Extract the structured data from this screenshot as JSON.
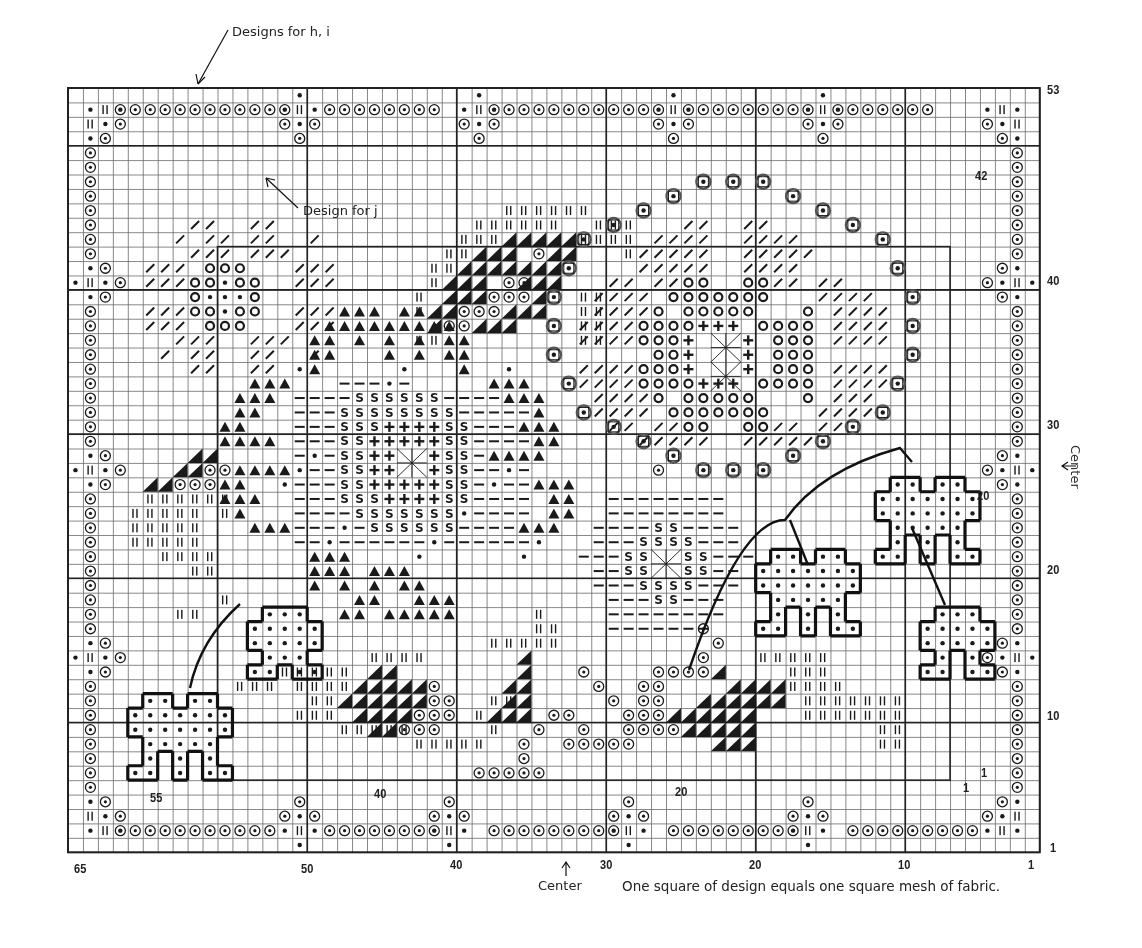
{
  "labels": {
    "designs_hi": "Designs for h, i",
    "design_j": "Design for j",
    "center_bottom": "Center",
    "center_right": "Center",
    "footnote": "One square of design equals one square mesh of fabric."
  },
  "axis": {
    "bottom_ticks": [
      "65",
      "50",
      "40",
      "30",
      "20",
      "10",
      "1"
    ],
    "right_ticks": [
      "53",
      "40",
      "30",
      "20",
      "10",
      "1"
    ],
    "inner_labels": {
      "top_right": "42",
      "mid_right": "20",
      "bottom_left": "55",
      "bottom_40": "40",
      "bottom_20": "20",
      "inner_1a": "1",
      "inner_1b": "1"
    }
  },
  "grid": {
    "cols": 65,
    "rows": 53,
    "left": 68,
    "top": 88,
    "cell_w": 14.95,
    "cell_h": 14.42,
    "inner_border": {
      "col_from": 55,
      "col_to": 6,
      "row_from": 42,
      "row_to": 5
    }
  },
  "legend": {
    "symbols": [
      "circle-dot",
      "dot",
      "double-bar",
      "slash",
      "ring",
      "plus",
      "dash",
      "s-letter",
      "triangle",
      "half-triangle",
      "boxed-dot",
      "star-cross"
    ]
  },
  "colors": {
    "ink": "#1a1a1a",
    "grid": "#555555",
    "paper": "#ffffff"
  }
}
